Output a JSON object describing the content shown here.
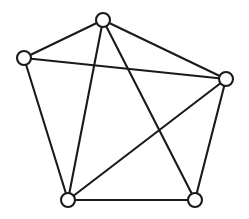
{
  "figure": {
    "background_color": "#ffffff",
    "stroke_color": "#1a1a1a",
    "stroke_width": 2.1,
    "width": 249,
    "height": 219
  },
  "graph_data": {
    "type": "graph",
    "directed": false,
    "weighted": false,
    "labeled": false,
    "vertex_count": 5,
    "edge_count": 9,
    "vertex_radius": 7,
    "vertex_fill": "#ffffff",
    "vertices": [
      {
        "id": "v-top",
        "name": "top-vertex",
        "x": 103,
        "y": 20,
        "degree": 4
      },
      {
        "id": "v-left",
        "name": "left-vertex",
        "x": 24,
        "y": 58,
        "degree": 3
      },
      {
        "id": "v-right",
        "name": "right-vertex",
        "x": 226,
        "y": 79,
        "degree": 4
      },
      {
        "id": "v-bottom-left",
        "name": "bottom-left-vertex",
        "x": 68,
        "y": 200,
        "degree": 4
      },
      {
        "id": "v-bottom-right",
        "name": "bottom-right-vertex",
        "x": 195,
        "y": 200,
        "degree": 3
      }
    ],
    "edges": [
      {
        "id": "e-top-left",
        "name": "edge-top-to-left",
        "from": "v-top",
        "to": "v-left",
        "x1": 103,
        "y1": 20,
        "x2": 24,
        "y2": 58
      },
      {
        "id": "e-top-right",
        "name": "edge-top-to-right",
        "from": "v-top",
        "to": "v-right",
        "x1": 103,
        "y1": 20,
        "x2": 226,
        "y2": 79
      },
      {
        "id": "e-top-bottom-left",
        "name": "edge-top-to-bottom-left",
        "from": "v-top",
        "to": "v-bottom-left",
        "x1": 103,
        "y1": 20,
        "x2": 68,
        "y2": 200
      },
      {
        "id": "e-top-bottom-right",
        "name": "edge-top-to-bottom-right",
        "from": "v-top",
        "to": "v-bottom-right",
        "x1": 103,
        "y1": 20,
        "x2": 195,
        "y2": 200
      },
      {
        "id": "e-left-right",
        "name": "edge-left-to-right",
        "from": "v-left",
        "to": "v-right",
        "x1": 24,
        "y1": 58,
        "x2": 226,
        "y2": 79
      },
      {
        "id": "e-left-bottom-left",
        "name": "edge-left-to-bottom-left",
        "from": "v-left",
        "to": "v-bottom-left",
        "x1": 24,
        "y1": 58,
        "x2": 68,
        "y2": 200
      },
      {
        "id": "e-right-bottom-left",
        "name": "edge-right-to-bottom-left",
        "from": "v-right",
        "to": "v-bottom-left",
        "x1": 226,
        "y1": 79,
        "x2": 68,
        "y2": 200
      },
      {
        "id": "e-right-bottom-right",
        "name": "edge-right-to-bottom-right",
        "from": "v-right",
        "to": "v-bottom-right",
        "x1": 226,
        "y1": 79,
        "x2": 195,
        "y2": 200
      },
      {
        "id": "e-bottom-left-bottom-right",
        "name": "edge-bottom-left-to-bottom-right",
        "from": "v-bottom-left",
        "to": "v-bottom-right",
        "x1": 68,
        "y1": 200,
        "x2": 195,
        "y2": 200
      }
    ],
    "missing_edges": [
      {
        "from": "v-left",
        "to": "v-bottom-right"
      }
    ],
    "notes": "Complete graph K5 with the left-to-bottom-right edge omitted. Two edges cross near the centre of the figure: top-to-bottom-right crosses right-to-bottom-left."
  }
}
